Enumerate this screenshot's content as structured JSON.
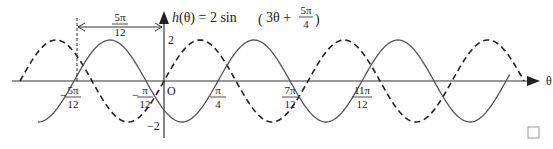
{
  "chart_data": {
    "type": "line",
    "title_parts": {
      "lhs": "h(θ) = 2 sin",
      "arg_main": "3θ + ",
      "frac_num": "5π",
      "frac_den": "4"
    },
    "xlabel": "θ",
    "ylabel": "",
    "origin_label": "O",
    "y_ticks": [
      {
        "value": 2,
        "label": "2"
      },
      {
        "value": -2,
        "label": "−2"
      }
    ],
    "x_ticks": [
      {
        "value_over_pi": -0.4167,
        "sign": "−",
        "num": "5π",
        "den": "12"
      },
      {
        "value_over_pi": -0.0833,
        "sign": "−",
        "num": "π",
        "den": "12"
      },
      {
        "value_over_pi": 0.25,
        "sign": "",
        "num": "π",
        "den": "4"
      },
      {
        "value_over_pi": 0.5833,
        "sign": "",
        "num": "7π",
        "den": "12"
      },
      {
        "value_over_pi": 0.9167,
        "sign": "",
        "num": "11π",
        "den": "12"
      }
    ],
    "shift_annotation": {
      "num": "5π",
      "den": "12",
      "from_over_pi": -0.4167,
      "to_over_pi": 0
    },
    "series": [
      {
        "name": "2 sin(3θ)",
        "style": "dashed",
        "amplitude": 2,
        "b": 3,
        "phase": 0,
        "x_range_over_pi": [
          -0.6667,
          1.6667
        ]
      },
      {
        "name": "2 sin(3θ + 5π/4)",
        "style": "solid",
        "amplitude": 2,
        "b": 3,
        "phase": 3.927,
        "x_range_over_pi": [
          -0.5833,
          1.6
        ]
      }
    ],
    "ylim": [
      -2,
      2
    ],
    "grid": false,
    "legend": "none",
    "colors": {
      "dashed": "#222222",
      "solid": "#555555",
      "axis": "#333333"
    }
  },
  "end_marker": "□"
}
